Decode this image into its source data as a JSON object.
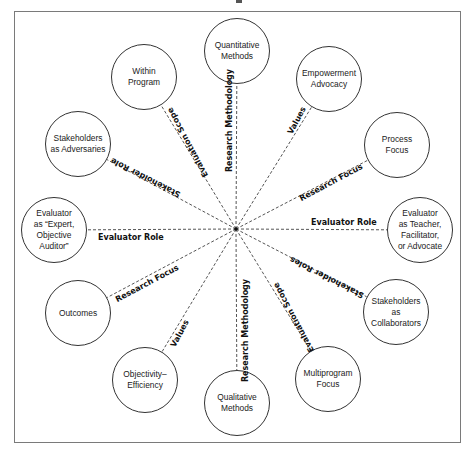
{
  "diagram": {
    "center": {
      "x": 236,
      "y": 229
    },
    "nodes": [
      {
        "id": "quantitative-methods",
        "label": "Quantitative\nMethods",
        "x": 237,
        "y": 51
      },
      {
        "id": "within-program",
        "label": "Within\nProgram",
        "x": 144,
        "y": 77
      },
      {
        "id": "empowerment-advocacy",
        "label": "Empowerment\nAdvocacy",
        "x": 329,
        "y": 79
      },
      {
        "id": "stakeholders-as-adversaries",
        "label": "Stakeholders\nas Adversaries",
        "x": 78,
        "y": 144
      },
      {
        "id": "process-focus",
        "label": "Process\nFocus",
        "x": 397,
        "y": 145
      },
      {
        "id": "evaluator-expert",
        "label": "Evaluator\nas “Expert,\nObjective\nAuditor”",
        "x": 54,
        "y": 230
      },
      {
        "id": "evaluator-teacher",
        "label": "Evaluator\nas Teacher,\nFacilitator,\nor Advocate",
        "x": 420,
        "y": 230
      },
      {
        "id": "outcomes",
        "label": "Outcomes",
        "x": 78,
        "y": 313
      },
      {
        "id": "stakeholders-as-collaborators",
        "label": "Stakeholders\nas\nCollaborators",
        "x": 396,
        "y": 312
      },
      {
        "id": "objectivity-efficiency",
        "label": "Objectivity–\nEfficiency",
        "x": 145,
        "y": 380
      },
      {
        "id": "multiprogram-focus",
        "label": "Multiprogram\nFocus",
        "x": 328,
        "y": 379
      },
      {
        "id": "qualitative-methods",
        "label": "Qualitative\nMethods",
        "x": 237,
        "y": 403
      }
    ],
    "edge_labels": [
      {
        "text": "Research Methodology",
        "x": 229,
        "y": 120,
        "rotate": -90
      },
      {
        "text": "Evaluation Scope",
        "x": 188,
        "y": 142,
        "rotate": 242
      },
      {
        "text": "Stakeholder Role",
        "x": 145,
        "y": 177,
        "rotate": 207
      },
      {
        "text": "Values",
        "x": 297,
        "y": 120,
        "rotate": -62
      },
      {
        "text": "Research Focus",
        "x": 331,
        "y": 182,
        "rotate": -28
      },
      {
        "text": "Evaluator Role",
        "x": 344,
        "y": 222,
        "rotate": 0
      },
      {
        "text": "Evaluator Role",
        "x": 131,
        "y": 237,
        "rotate": 0
      },
      {
        "text": "Stakeholder Roles",
        "x": 327,
        "y": 277,
        "rotate": 207
      },
      {
        "text": "Evaluation Scope",
        "x": 294,
        "y": 317,
        "rotate": 242
      },
      {
        "text": "Research Methodology",
        "x": 245,
        "y": 330,
        "rotate": -90
      },
      {
        "text": "Values",
        "x": 180,
        "y": 333,
        "rotate": -62
      },
      {
        "text": "Research Focus",
        "x": 147,
        "y": 283,
        "rotate": -28
      }
    ]
  }
}
